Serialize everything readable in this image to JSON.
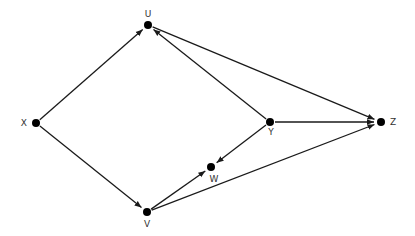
{
  "diagram": {
    "type": "directed-graph",
    "colors": {
      "edge": "#1a1a1a",
      "node": "#000000",
      "label": "#333333",
      "background": "#ffffff"
    },
    "nodes": [
      {
        "id": "U",
        "label": "U",
        "x": 148,
        "y": 25,
        "label_dx": 0,
        "label_dy": -8,
        "anchor": "middle"
      },
      {
        "id": "X",
        "label": "X",
        "x": 36,
        "y": 123,
        "label_dx": -9,
        "label_dy": 3,
        "anchor": "end"
      },
      {
        "id": "V",
        "label": "V",
        "x": 147,
        "y": 212,
        "label_dx": 0,
        "label_dy": 15,
        "anchor": "middle"
      },
      {
        "id": "W",
        "label": "W",
        "x": 211,
        "y": 167,
        "label_dx": 3,
        "label_dy": 15,
        "anchor": "middle"
      },
      {
        "id": "Y",
        "label": "Y",
        "x": 270,
        "y": 122,
        "label_dx": 1,
        "label_dy": 13,
        "anchor": "middle"
      },
      {
        "id": "Z",
        "label": "Z",
        "x": 381,
        "y": 122,
        "label_dx": 9,
        "label_dy": 3,
        "anchor": "start"
      }
    ],
    "edges": [
      {
        "from": "X",
        "to": "U"
      },
      {
        "from": "X",
        "to": "V"
      },
      {
        "from": "U",
        "to": "Z"
      },
      {
        "from": "Y",
        "to": "U"
      },
      {
        "from": "Y",
        "to": "Z"
      },
      {
        "from": "Y",
        "to": "W"
      },
      {
        "from": "V",
        "to": "W"
      },
      {
        "from": "V",
        "to": "Z"
      }
    ]
  }
}
